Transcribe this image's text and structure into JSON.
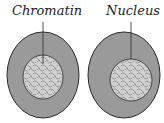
{
  "labels": {
    "left": "Chromatin",
    "right": "Nucleus"
  },
  "colors": {
    "cytoplasm": "#9a9a9a",
    "nucleus": "#cfcfcf",
    "outline": "#2a2a2a",
    "chromatin": "#6e6e6e"
  },
  "cells": [
    {
      "name": "left-cell",
      "label": "Chromatin"
    },
    {
      "name": "right-cell",
      "label": "Nucleus"
    }
  ]
}
